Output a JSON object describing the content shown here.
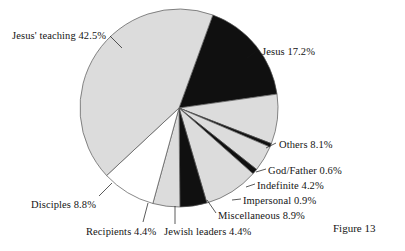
{
  "figure": {
    "caption": "Figure 13"
  },
  "chart_data": {
    "type": "pie",
    "title": "",
    "subtitle": "",
    "xlabel": "",
    "ylabel": "",
    "legend_position": "none",
    "grid": false,
    "units": "percent",
    "start_angle_deg_from_top": 20,
    "direction": "clockwise",
    "center": {
      "x": 179,
      "y": 108
    },
    "radius": 99,
    "categories": [
      "Jesus",
      "Others",
      "God/Father",
      "Indefinite",
      "Impersonal",
      "Miscellaneous",
      "Jewish leaders",
      "Recipients",
      "Disciples",
      "Jesus' teaching"
    ],
    "values": [
      17.2,
      8.1,
      0.6,
      4.2,
      0.9,
      8.9,
      4.4,
      4.4,
      8.8,
      42.5
    ],
    "slices": [
      {
        "label": "Jesus",
        "value": 17.2,
        "text": "Jesus 17.2%",
        "fill": "#101010",
        "label_x": 262,
        "label_y": 46,
        "leader": [
          [
            247,
            58
          ],
          [
            258,
            50
          ]
        ]
      },
      {
        "label": "Others",
        "value": 8.1,
        "text": "Others 8.1%",
        "fill": "#dcdcdc",
        "label_x": 279,
        "label_y": 139,
        "leader": [
          [
            266,
            148
          ],
          [
            276,
            143
          ]
        ]
      },
      {
        "label": "God/Father",
        "value": 0.6,
        "text": "God/Father 0.6%",
        "fill": "#101010",
        "label_x": 268,
        "label_y": 165,
        "leader": [
          [
            256,
            172
          ],
          [
            266,
            169
          ]
        ]
      },
      {
        "label": "Indefinite",
        "value": 4.2,
        "text": "Indefinite 4.2%",
        "fill": "#dcdcdc",
        "label_x": 257,
        "label_y": 180,
        "leader": [
          [
            246,
            187
          ],
          [
            255,
            184
          ]
        ]
      },
      {
        "label": "Impersonal",
        "value": 0.9,
        "text": "Impersonal 0.9%",
        "fill": "#101010",
        "label_x": 243,
        "label_y": 195,
        "leader": [
          [
            232,
            200
          ],
          [
            241,
            199
          ]
        ]
      },
      {
        "label": "Miscellaneous",
        "value": 8.9,
        "text": "Miscellaneous 8.9%",
        "fill": "#dcdcdc",
        "label_x": 218,
        "label_y": 210,
        "leader": [
          [
            207,
            200
          ],
          [
            216,
            213
          ]
        ]
      },
      {
        "label": "Jewish leaders",
        "value": 4.4,
        "text": "Jewish leaders 4.4%",
        "fill": "#101010",
        "label_x": 164,
        "label_y": 226,
        "leader": [
          [
            175,
            206
          ],
          [
            175,
            224
          ]
        ]
      },
      {
        "label": "Recipients",
        "value": 4.4,
        "text": "Recipients 4.4%",
        "fill": "#dcdcdc",
        "label_x": 86,
        "label_y": 226,
        "leader": [
          [
            148,
            203
          ],
          [
            143,
            222
          ]
        ]
      },
      {
        "label": "Disciples",
        "value": 8.8,
        "text": "Disciples 8.8%",
        "fill": "#ffffff",
        "label_x": 31,
        "label_y": 199,
        "leader": [
          [
            112,
            183
          ],
          [
            99,
            196
          ]
        ]
      },
      {
        "label": "Jesus' teaching",
        "value": 42.5,
        "text": "Jesus' teaching 42.5%",
        "fill": "#dcdcdc",
        "label_x": 12,
        "label_y": 30,
        "leader": [
          [
            122,
            48
          ],
          [
            110,
            36
          ]
        ]
      }
    ],
    "colors": {
      "gray_fill": "#dcdcdc",
      "black_fill": "#101010",
      "white_fill": "#ffffff",
      "outline": "#555555",
      "text": "#141414",
      "background": "#ffffff"
    }
  }
}
